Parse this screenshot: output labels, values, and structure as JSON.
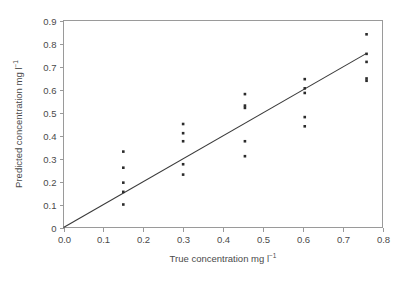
{
  "chart_data": {
    "type": "scatter",
    "title": "",
    "xlabel": "True concentration mg l⁻¹",
    "ylabel": "Predicted concentration mg l⁻¹",
    "xlabel_main": "True concentration mg l",
    "xlabel_sup": "−1",
    "ylabel_main": "Predicted concentration mg l",
    "ylabel_sup": "−1",
    "xlim": [
      0.0,
      0.8
    ],
    "ylim": [
      0.0,
      0.9
    ],
    "xticks": [
      0.0,
      0.1,
      0.2,
      0.3,
      0.4,
      0.5,
      0.6,
      0.7,
      0.8
    ],
    "yticks": [
      0,
      0.1,
      0.2,
      0.3,
      0.4,
      0.5,
      0.6,
      0.7,
      0.8,
      0.9
    ],
    "xtick_labels": [
      "0.0",
      "0.1",
      "0.2",
      "0.3",
      "0.4",
      "0.5",
      "0.6",
      "0.7",
      "0.8"
    ],
    "ytick_labels": [
      "0",
      "0.1",
      "0.2",
      "0.3",
      "0.4",
      "0.5",
      "0.6",
      "0.7",
      "0.8",
      "0.9"
    ],
    "grid": false,
    "legend": "none",
    "marker_style": "small-filled-square",
    "marker_color": "#2b2b2b",
    "points": [
      {
        "x": 0.15,
        "y": 0.33
      },
      {
        "x": 0.15,
        "y": 0.26
      },
      {
        "x": 0.15,
        "y": 0.195
      },
      {
        "x": 0.15,
        "y": 0.155
      },
      {
        "x": 0.15,
        "y": 0.1
      },
      {
        "x": 0.3,
        "y": 0.45
      },
      {
        "x": 0.3,
        "y": 0.41
      },
      {
        "x": 0.3,
        "y": 0.375
      },
      {
        "x": 0.3,
        "y": 0.275
      },
      {
        "x": 0.3,
        "y": 0.23
      },
      {
        "x": 0.455,
        "y": 0.58
      },
      {
        "x": 0.455,
        "y": 0.53
      },
      {
        "x": 0.455,
        "y": 0.52
      },
      {
        "x": 0.455,
        "y": 0.375
      },
      {
        "x": 0.455,
        "y": 0.31
      },
      {
        "x": 0.605,
        "y": 0.645
      },
      {
        "x": 0.605,
        "y": 0.605
      },
      {
        "x": 0.605,
        "y": 0.585
      },
      {
        "x": 0.605,
        "y": 0.48
      },
      {
        "x": 0.605,
        "y": 0.44
      },
      {
        "x": 0.76,
        "y": 0.84
      },
      {
        "x": 0.76,
        "y": 0.755
      },
      {
        "x": 0.76,
        "y": 0.72
      },
      {
        "x": 0.76,
        "y": 0.648
      },
      {
        "x": 0.76,
        "y": 0.638
      }
    ],
    "fit_line": {
      "label": "",
      "x": [
        0.0,
        0.76
      ],
      "y": [
        0.0,
        0.757
      ],
      "slope": 0.996,
      "intercept": 0.0
    }
  }
}
